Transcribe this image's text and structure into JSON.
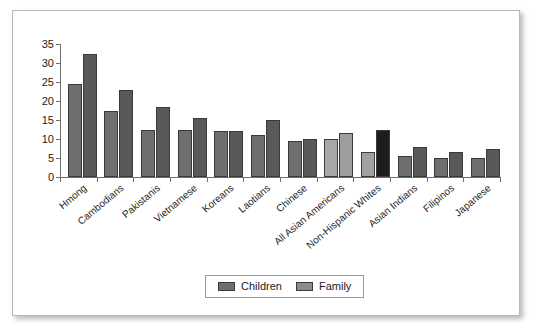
{
  "chart_data": {
    "type": "bar",
    "title": "",
    "xlabel": "",
    "ylabel": "",
    "ylim": [
      0,
      35
    ],
    "ytick_step": 5,
    "yticks": [
      "0",
      "5",
      "10",
      "15",
      "20",
      "25",
      "30",
      "35"
    ],
    "grid": false,
    "legend_position": "bottom-center",
    "categories": [
      "Hmong",
      "Cambodians",
      "Pakistanis",
      "Vietnamese",
      "Koreans",
      "Laotians",
      "Chinese",
      "All Asian Americans",
      "Non-Hispanic Whites",
      "Asian Indians",
      "Filipinos",
      "Japanese"
    ],
    "series": [
      {
        "name": "Children",
        "color": "#6e6e6e",
        "values": [
          24.5,
          17.5,
          12.5,
          12.5,
          12,
          11,
          9.5,
          10,
          6.5,
          5.5,
          5,
          5
        ]
      },
      {
        "name": "Family",
        "color": "#595959",
        "values": [
          32.5,
          23,
          18.5,
          15.5,
          12,
          15,
          10,
          11.5,
          12.5,
          8,
          6.5,
          7.5
        ]
      }
    ],
    "bar_colors": {
      "default_children": "#6e6e6e",
      "default_family": "#595959",
      "all_asian_americans_children": "#a8a8a8",
      "all_asian_americans_family": "#9d9d9d",
      "non_hispanic_whites_children": "#a0a0a0",
      "non_hispanic_whites_family": "#1d1d1d"
    }
  },
  "legend": {
    "entries": [
      {
        "label": "Children",
        "color": "#6e6e6e"
      },
      {
        "label": "Family",
        "color": "#8c8c8c"
      }
    ]
  },
  "panel": {
    "border_color": "#b8b8b8",
    "background": "#ffffff"
  }
}
